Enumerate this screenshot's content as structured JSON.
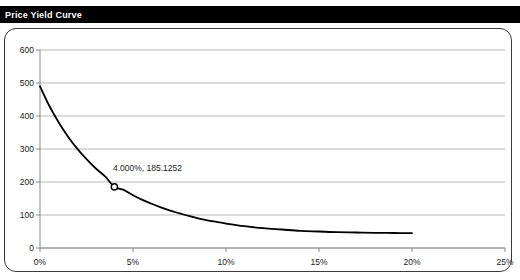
{
  "window": {
    "title": "Price Yield Curve"
  },
  "colors": {
    "title_bar_bg": "#000000",
    "title_text": "#ffffff",
    "frame_border": "#3a3a3a",
    "grid": "#b7b7b7",
    "axis": "#8a8a8a",
    "curve": "#000000",
    "marker_fill": "#ffffff",
    "marker_stroke": "#000000",
    "plot_bg": "#ffffff"
  },
  "chart_data": {
    "type": "line",
    "title": "Price Yield Curve",
    "xlabel": "",
    "ylabel": "",
    "xlim": [
      0,
      25
    ],
    "ylim": [
      0,
      600
    ],
    "grid": true,
    "legend": "none",
    "x_tick_labels": [
      "0%",
      "5%",
      "10%",
      "15%",
      "20%",
      "25%"
    ],
    "x_ticks": [
      0,
      5,
      10,
      15,
      20,
      25
    ],
    "y_tick_labels": [
      "0",
      "100",
      "200",
      "300",
      "400",
      "500",
      "600"
    ],
    "y_ticks": [
      0,
      100,
      200,
      300,
      400,
      500,
      600
    ],
    "series": [
      {
        "name": "Price",
        "x": [
          0.0,
          0.5,
          1.0,
          1.5,
          2.0,
          2.5,
          3.0,
          3.5,
          4.0,
          4.5,
          5.0,
          5.5,
          6.0,
          6.5,
          7.0,
          7.5,
          8.0,
          8.5,
          9.0,
          9.5,
          10.0,
          11.0,
          12.0,
          13.0,
          14.0,
          15.0,
          16.0,
          17.0,
          18.0,
          19.0,
          20.0
        ],
        "y": [
          490.0,
          431.0,
          381.0,
          338.0,
          301.0,
          269.0,
          241.0,
          217.0,
          185.1252,
          176.0,
          160.0,
          146.0,
          134.0,
          123.0,
          113.0,
          105.0,
          97.0,
          90.0,
          84.0,
          79.0,
          74.0,
          66.0,
          60.0,
          56.0,
          52.0,
          50.0,
          48.0,
          47.0,
          46.0,
          45.5,
          45.0
        ]
      }
    ],
    "markers": [
      {
        "name": "current-point",
        "x": 4.0,
        "y": 185.1252,
        "label": "4.000%, 185.1252"
      }
    ]
  }
}
